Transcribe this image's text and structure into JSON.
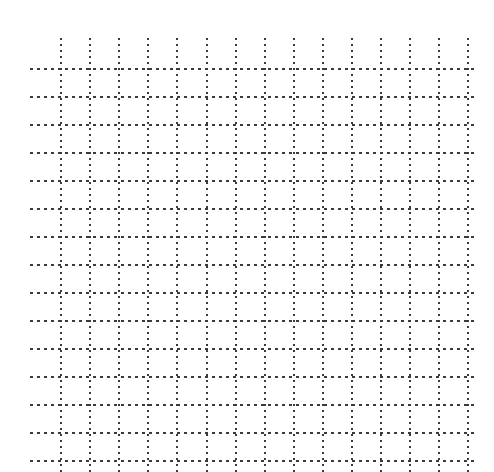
{
  "canvas": {
    "width": 494,
    "height": 472,
    "background_color": "#ffffff"
  },
  "grid": {
    "line_color": "#3a3a3a",
    "style": "dotted",
    "vertical": {
      "count": 15,
      "first_x": 60,
      "pitch": 29.1,
      "thickness": 2,
      "start_y": 38,
      "end_y": 472,
      "dash_length": 2,
      "dash_gap": 4
    },
    "horizontal": {
      "count": 15,
      "first_y": 68,
      "pitch": 28.0,
      "thickness": 2,
      "start_x": 30,
      "end_x": 478,
      "dash_length": 3,
      "dash_gap": 4
    }
  },
  "chart_data": {
    "type": "table",
    "title": "",
    "subtitle": "",
    "xlabel": "",
    "ylabel": "",
    "grid": true,
    "legend": null,
    "annotations": [],
    "categories": [],
    "values": [],
    "series": []
  }
}
